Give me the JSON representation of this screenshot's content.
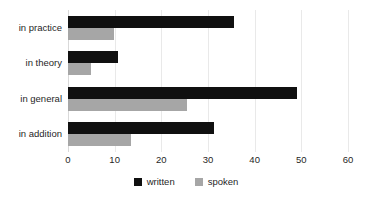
{
  "chart_data": {
    "type": "bar",
    "orientation": "horizontal",
    "title": "",
    "subtitle": "",
    "xlabel": "",
    "ylabel": "",
    "xlim": [
      0,
      60
    ],
    "xticks": [
      "0",
      "10",
      "20",
      "30",
      "40",
      "50",
      "60"
    ],
    "xtick_values": [
      0,
      10,
      20,
      30,
      40,
      50,
      60
    ],
    "grid": true,
    "legend_position": "bottom",
    "categories": [
      "in practice",
      "in theory",
      "in general",
      "in addition"
    ],
    "series": [
      {
        "name": "written",
        "color": "#101010",
        "values": [
          35.6,
          10.7,
          49.0,
          31.3
        ]
      },
      {
        "name": "spoken",
        "color": "#a6a6a6",
        "values": [
          9.9,
          5.0,
          25.5,
          13.5
        ]
      }
    ]
  },
  "legend": {
    "items": [
      {
        "label": "written",
        "swatch": "written"
      },
      {
        "label": "spoken",
        "swatch": "spoken"
      }
    ]
  },
  "colors": {
    "written": "#101010",
    "spoken": "#a6a6a6",
    "grid": "#e9e9e9",
    "text": "#1f1f1f",
    "background": "#ffffff"
  }
}
